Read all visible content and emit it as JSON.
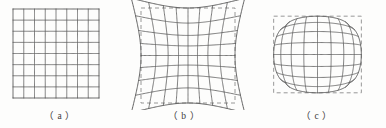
{
  "figure": {
    "width": 386,
    "height": 128,
    "background_color": "#fdfdfc",
    "line_color": "#5a5a5a",
    "dashed_color": "#8c8c8c",
    "caption_color": "#3a3a3a"
  },
  "panels": [
    {
      "id": "panel-a",
      "caption": "（ a ）",
      "distortion_type": "none",
      "description": "undistorted regular square grid",
      "grid": {
        "columns": 8,
        "rows": 8
      },
      "has_dashed_reference": false,
      "box": {
        "x": 13,
        "y": 9,
        "width": 86,
        "height": 89
      },
      "coefficient_k": 0.0
    },
    {
      "id": "panel-b",
      "caption": "（ b ）",
      "distortion_type": "barrel",
      "description": "barrel distortion: lines bow outward from center, corners pull inward",
      "grid": {
        "columns": 8,
        "rows": 8
      },
      "has_dashed_reference": true,
      "box": {
        "x": 139,
        "y": 6,
        "width": 94,
        "height": 95
      },
      "coefficient_k": 0.26
    },
    {
      "id": "panel-c",
      "caption": "（ c ）",
      "distortion_type": "pincushion",
      "description": "pincushion distortion: edges bow inward, corners stretch outward",
      "grid": {
        "columns": 8,
        "rows": 8
      },
      "has_dashed_reference": true,
      "box": {
        "x": 264,
        "y": 4,
        "width": 111,
        "height": 97
      },
      "coefficient_k": -0.21
    }
  ]
}
